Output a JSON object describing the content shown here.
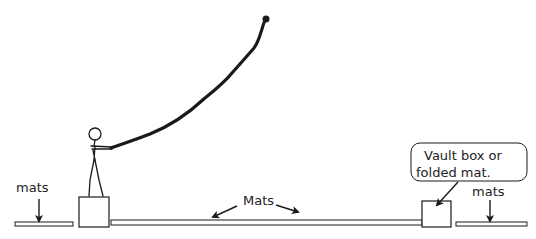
{
  "diagram": {
    "colors": {
      "ink": "#1a1a1a",
      "mat_fill": "#ffffff",
      "background": "#ffffff"
    },
    "labels": {
      "left_mats": "mats",
      "center_mats": "Mats",
      "right_mats": "mats",
      "callout_line1": "Vault box or",
      "callout_line2": "folded mat."
    },
    "elements": [
      {
        "id": "rope",
        "kind": "rope",
        "description": "Rope held by figure, anchored at top"
      },
      {
        "id": "stick-figure",
        "kind": "person",
        "description": "Person standing on left box holding rope"
      },
      {
        "id": "left-box",
        "kind": "box"
      },
      {
        "id": "right-box",
        "kind": "box",
        "description": "Vault box or folded mat"
      },
      {
        "id": "left-mat",
        "kind": "mat"
      },
      {
        "id": "center-mat",
        "kind": "mat"
      },
      {
        "id": "right-mat",
        "kind": "mat"
      }
    ]
  }
}
